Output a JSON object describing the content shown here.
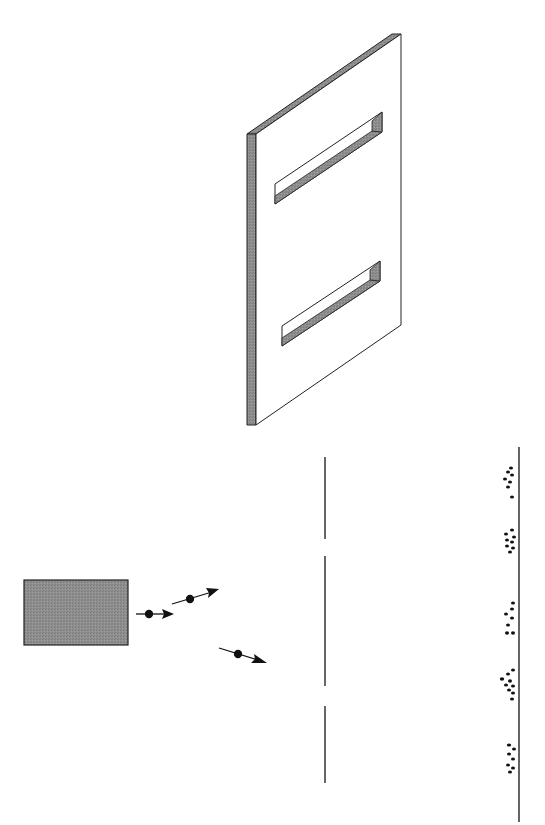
{
  "diagram": {
    "colors": {
      "stroke": "#222222",
      "slab_edge": "#8a8a8a",
      "source_fill": "#8c8c8c",
      "particle": "#111111"
    },
    "components": [
      {
        "id": "slit-plate-3d",
        "label": "Plate with two slits (perspective view)"
      },
      {
        "id": "particle-source",
        "label": "Particle source"
      },
      {
        "id": "particles",
        "label": "Particles in flight",
        "count": 3
      },
      {
        "id": "barrier",
        "label": "Barrier with two slits"
      },
      {
        "id": "detection-screen",
        "label": "Detection screen"
      },
      {
        "id": "hit-clusters",
        "label": "Particle impact bands",
        "count": 5
      }
    ]
  }
}
